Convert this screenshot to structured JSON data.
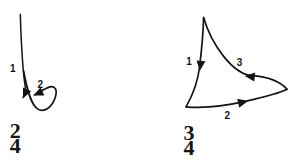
{
  "colors": {
    "ink": "#141414",
    "background": "#ffffff"
  },
  "figures": {
    "two_four": {
      "name": "2/4 conducting beat pattern",
      "beat_labels": {
        "b1": "1",
        "b2": "2"
      },
      "time_signature": {
        "numerator": "2",
        "denominator": "4"
      }
    },
    "three_four": {
      "name": "3/4 conducting beat pattern",
      "beat_labels": {
        "b1": "1",
        "b2": "2",
        "b3": "3"
      },
      "time_signature": {
        "numerator": "3",
        "denominator": "4"
      }
    }
  }
}
